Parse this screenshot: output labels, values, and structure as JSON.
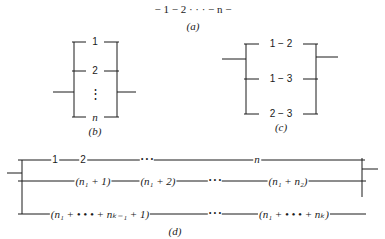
{
  "panels": {
    "a": {
      "caption": "(a)",
      "chain": "− 1 − 2 · · · − n −"
    },
    "b": {
      "caption": "(b)",
      "rows": [
        "1",
        "2",
        "⋮",
        "n"
      ]
    },
    "c": {
      "caption": "(c)",
      "rows": [
        "1 − 2",
        "1 − 3",
        "2 − 3"
      ]
    },
    "d": {
      "caption": "(d)",
      "row1": {
        "items": [
          "1",
          "2",
          "• • •",
          "n"
        ]
      },
      "row2": {
        "items": [
          "(n₁ + 1)",
          "(n₁ + 2)",
          "• • •",
          "(n₁ + n₂)"
        ]
      },
      "row3": {
        "items": [
          "(n₁ + • • • + nₖ₋₁ + 1)",
          "• • •",
          "(n₁ + • • • + nₖ)"
        ]
      }
    }
  }
}
